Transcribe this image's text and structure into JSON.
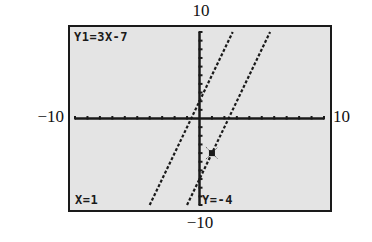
{
  "chart_data": {
    "type": "line",
    "title": "",
    "xlabel": "",
    "ylabel": "",
    "xlim": [
      -10,
      10
    ],
    "ylim": [
      -10,
      10
    ],
    "xscale_ticks": 1,
    "yscale_ticks": 1,
    "grid": false,
    "window_labels": {
      "ymax": "10",
      "ymin": "−10",
      "xmin": "−10",
      "xmax": "10"
    },
    "series": [
      {
        "name": "Y1",
        "equation": "Y1=3X-7",
        "slope": 3,
        "intercept": -7,
        "style": "dotted"
      },
      {
        "name": "Y2",
        "slope": 3,
        "intercept": 2,
        "style": "dotted"
      }
    ],
    "trace_cursor": {
      "x": 1,
      "y": -4,
      "series": "Y1"
    },
    "annotations": {
      "equation_label": "Y1=3X-7",
      "x_readout": "X=1",
      "y_readout": "Y=-4"
    }
  },
  "colors": {
    "screen_bg": "#e4e4e4",
    "ink": "#1a1a1a"
  }
}
